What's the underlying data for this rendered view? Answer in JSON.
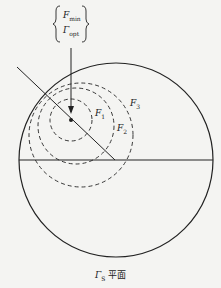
{
  "diagram": {
    "title_box": {
      "line1": {
        "symbol": "F",
        "sub": "min"
      },
      "line2": {
        "symbol": "Γ",
        "sub": "opt"
      }
    },
    "circle_labels": [
      {
        "symbol": "F",
        "sub": "1"
      },
      {
        "symbol": "F",
        "sub": "2"
      },
      {
        "symbol": "F",
        "sub": "3"
      }
    ],
    "caption": {
      "symbol": "Γ",
      "sub": "S",
      "text": "平面"
    },
    "colors": {
      "stroke": "#222222",
      "background": "#f4f4f2"
    }
  }
}
